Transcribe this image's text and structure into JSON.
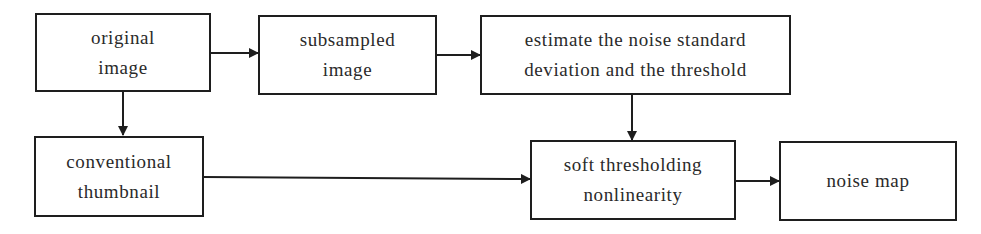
{
  "diagram": {
    "type": "flowchart",
    "nodes": [
      {
        "id": "original",
        "lines": [
          "original",
          "image"
        ]
      },
      {
        "id": "subsampled",
        "lines": [
          "subsampled",
          "image"
        ]
      },
      {
        "id": "estimate",
        "lines": [
          "estimate the noise standard",
          "deviation and the threshold"
        ]
      },
      {
        "id": "thumbnail",
        "lines": [
          "conventional",
          "thumbnail"
        ]
      },
      {
        "id": "soft",
        "lines": [
          "soft thresholding",
          "nonlinearity"
        ]
      },
      {
        "id": "noisemap",
        "lines": [
          "noise map"
        ]
      }
    ],
    "edges": [
      {
        "from": "original",
        "to": "subsampled"
      },
      {
        "from": "subsampled",
        "to": "estimate"
      },
      {
        "from": "original",
        "to": "thumbnail"
      },
      {
        "from": "estimate",
        "to": "soft"
      },
      {
        "from": "thumbnail",
        "to": "soft"
      },
      {
        "from": "soft",
        "to": "noisemap"
      }
    ],
    "colors": {
      "stroke": "#1e1e1e",
      "background": "#ffffff",
      "text": "#2a2a2a"
    }
  }
}
